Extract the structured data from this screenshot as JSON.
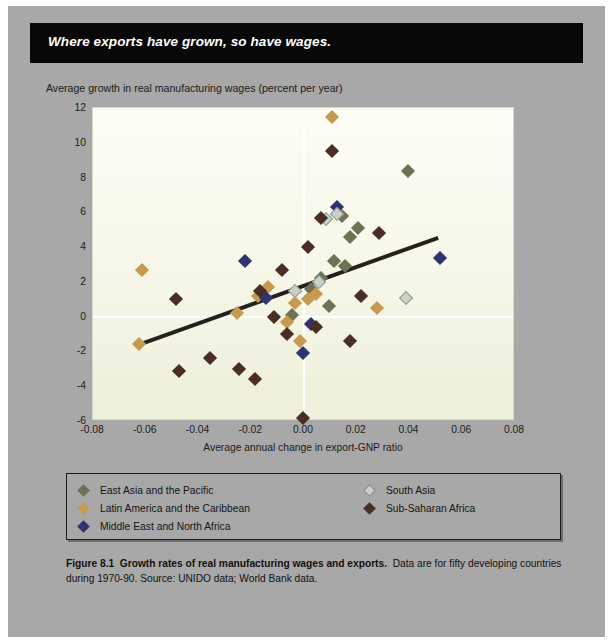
{
  "banner": {
    "title": "Where exports have grown, so have wages."
  },
  "chart_data": {
    "type": "scatter",
    "title": "Where exports have grown, so have wages.",
    "xlabel": "Average annual change in export-GNP ratio",
    "ylabel": "Average growth in real manufacturing wages (percent per year)",
    "xlim": [
      -0.08,
      0.08
    ],
    "ylim": [
      -6,
      12
    ],
    "xticks": [
      "-0.08",
      "-0.06",
      "-0.04",
      "-0.02",
      "0.00",
      "0.02",
      "0.04",
      "0.06",
      "0.08"
    ],
    "xtick_values": [
      -0.08,
      -0.06,
      -0.04,
      -0.02,
      0.0,
      0.02,
      0.04,
      0.06,
      0.08
    ],
    "yticks": [
      "12",
      "10",
      "8",
      "6",
      "4",
      "2",
      "0",
      "-2",
      "-4",
      "-6"
    ],
    "ytick_values": [
      12,
      10,
      8,
      6,
      4,
      2,
      0,
      -2,
      -4,
      -6
    ],
    "grid": "zero-lines-only",
    "legend_position": "below-axes",
    "trendline": {
      "label": "fitted regression line",
      "x_start": -0.063,
      "y_start": -1.7,
      "x_end": 0.0515,
      "y_end": 4.5,
      "color": "#24211c"
    },
    "series": [
      {
        "name": "East Asia and the Pacific",
        "color": "#6e7153",
        "points": [
          [
            0.0395,
            8.4
          ],
          [
            0.0145,
            5.8
          ],
          [
            0.0175,
            4.6
          ],
          [
            0.0115,
            3.2
          ],
          [
            0.0065,
            2.2
          ],
          [
            0.0025,
            1.6
          ],
          [
            0.0155,
            2.9
          ],
          [
            0.0095,
            0.6
          ],
          [
            -0.0045,
            0.1
          ],
          [
            0.0205,
            5.1
          ]
        ]
      },
      {
        "name": "Latin America and the Caribbean",
        "color": "#c69a50",
        "points": [
          [
            -0.0615,
            2.7
          ],
          [
            -0.0255,
            0.2
          ],
          [
            -0.0175,
            1.2
          ],
          [
            -0.0135,
            1.7
          ],
          [
            -0.0625,
            -1.6
          ],
          [
            -0.0035,
            0.8
          ],
          [
            0.0015,
            1.0
          ],
          [
            0.0045,
            1.3
          ],
          [
            0.0105,
            11.5
          ],
          [
            0.0275,
            0.5
          ],
          [
            -0.0065,
            -0.3
          ],
          [
            -0.0015,
            -1.4
          ]
        ]
      },
      {
        "name": "Middle East and North Africa",
        "color": "#2e3470",
        "points": [
          [
            -0.0225,
            3.2
          ],
          [
            -0.0145,
            1.1
          ],
          [
            0.0125,
            6.3
          ],
          [
            0.0515,
            3.4
          ],
          [
            0.0025,
            -0.4
          ],
          [
            -0.0005,
            -2.1
          ]
        ]
      },
      {
        "name": "South Asia",
        "color": "#c8d2c8",
        "points": [
          [
            0.0085,
            5.6
          ],
          [
            0.0385,
            1.1
          ],
          [
            0.0055,
            2.0
          ],
          [
            0.0125,
            5.9
          ],
          [
            -0.0035,
            1.5
          ]
        ]
      },
      {
        "name": "Sub-Saharan Africa",
        "color": "#4a2e26",
        "points": [
          [
            0.0105,
            9.5
          ],
          [
            0.0065,
            5.7
          ],
          [
            0.0285,
            4.8
          ],
          [
            0.0015,
            4.0
          ],
          [
            -0.0165,
            1.5
          ],
          [
            -0.0485,
            1.0
          ],
          [
            -0.0475,
            -3.1
          ],
          [
            -0.0355,
            -2.4
          ],
          [
            -0.0245,
            -3.0
          ],
          [
            -0.0185,
            -3.6
          ],
          [
            -0.0065,
            -1.0
          ],
          [
            0.0045,
            -0.6
          ],
          [
            -0.0115,
            0.0
          ],
          [
            0.0175,
            -1.4
          ],
          [
            -0.0005,
            -5.8
          ],
          [
            -0.0085,
            2.7
          ],
          [
            0.0215,
            1.2
          ]
        ]
      }
    ]
  },
  "legend": {
    "left_items": [
      {
        "label": "East Asia and the Pacific",
        "color": "#6e7153"
      },
      {
        "label": "Latin America and the Caribbean",
        "color": "#c69a50"
      },
      {
        "label": "Middle East and North Africa",
        "color": "#2e3470"
      }
    ],
    "right_items": [
      {
        "label": "South Asia",
        "color": "#c8d2c8"
      },
      {
        "label": "Sub-Saharan Africa",
        "color": "#4a2e26"
      }
    ]
  },
  "caption": {
    "figure_number": "Figure 8.1",
    "bold_title": "Growth rates of real manufacturing wages and exports.",
    "body": "Data are for fifty developing countries during 1970-90. Source: UNIDO data; World Bank data."
  }
}
